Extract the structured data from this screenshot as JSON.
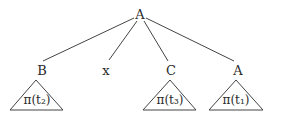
{
  "diagram": {
    "type": "tree",
    "root": {
      "label": "A"
    },
    "children": [
      {
        "label": "B",
        "subtree": "π(t₂)"
      },
      {
        "label": "x",
        "subtree": null
      },
      {
        "label": "C",
        "subtree": "π(t₃)"
      },
      {
        "label": "A",
        "subtree": "π(t₁)"
      }
    ]
  }
}
